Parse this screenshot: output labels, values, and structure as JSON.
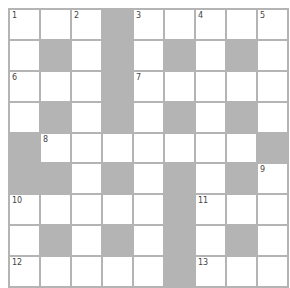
{
  "puzzle": {
    "rows": 9,
    "cols": 9,
    "colors": {
      "grid_line": "#b4b4b4",
      "block": "#b4b4b4",
      "cell": "#ffffff",
      "number": "#444444"
    },
    "grid": [
      ". . . X . . . . .",
      ". X . X . X . X .",
      ". . . X . . . . .",
      ". X . X . X . X .",
      "X . . . . . . . X",
      "X X . X . X . X .",
      ". . . . . X . . .",
      ". X . X . X . X .",
      ". . . . . X . . ."
    ],
    "numbers": [
      {
        "n": "1",
        "r": 0,
        "c": 0
      },
      {
        "n": "2",
        "r": 0,
        "c": 2
      },
      {
        "n": "3",
        "r": 0,
        "c": 4
      },
      {
        "n": "4",
        "r": 0,
        "c": 6
      },
      {
        "n": "5",
        "r": 0,
        "c": 8
      },
      {
        "n": "6",
        "r": 2,
        "c": 0
      },
      {
        "n": "7",
        "r": 2,
        "c": 4
      },
      {
        "n": "8",
        "r": 4,
        "c": 1
      },
      {
        "n": "9",
        "r": 5,
        "c": 8
      },
      {
        "n": "10",
        "r": 6,
        "c": 0
      },
      {
        "n": "11",
        "r": 6,
        "c": 6
      },
      {
        "n": "12",
        "r": 8,
        "c": 0
      },
      {
        "n": "13",
        "r": 8,
        "c": 6
      }
    ]
  }
}
